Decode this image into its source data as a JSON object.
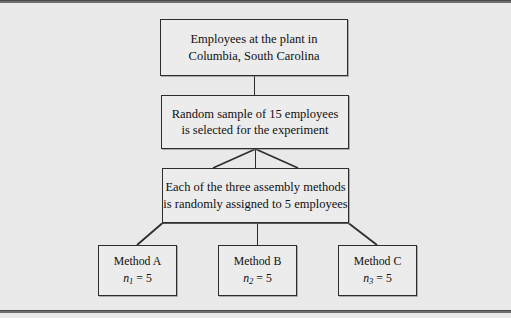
{
  "diagram": {
    "type": "flow-diagram",
    "background_color": "#e9e9e9",
    "box_fill_color": "#ececec",
    "box_border_color": "#2d2d2d",
    "connector_color": "#2d2d2d",
    "frame": {
      "top_rule_color": "#6e6e6e",
      "bottom_rule_color": "#6e6e6e"
    },
    "nodes": {
      "population": {
        "label_line1": "Employees at the plant in",
        "label_line2": "Columbia, South Carolina"
      },
      "sample": {
        "label_line1": "Random sample of 15 employees",
        "label_line2": "is selected for the experiment"
      },
      "assignment": {
        "label_line1": "Each of the three assembly methods",
        "label_line2": "is randomly assigned to 5 employees"
      },
      "treatments": [
        {
          "label": "Method A",
          "stat_variable": "n",
          "stat_subscript": "1",
          "stat_operator": "=",
          "stat_value": "5"
        },
        {
          "label": "Method B",
          "stat_variable": "n",
          "stat_subscript": "2",
          "stat_operator": "=",
          "stat_value": "5"
        },
        {
          "label": "Method C",
          "stat_variable": "n",
          "stat_subscript": "3",
          "stat_operator": "=",
          "stat_value": "5"
        }
      ]
    }
  }
}
